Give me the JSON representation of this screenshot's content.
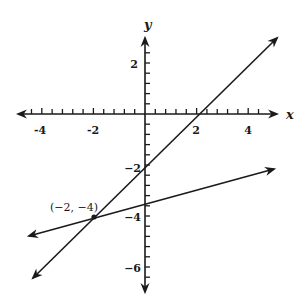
{
  "chart_data": {
    "type": "line",
    "title": "",
    "xlabel": "x",
    "ylabel": "y",
    "xlim": [
      -5,
      5
    ],
    "ylim": [
      -7,
      3.5
    ],
    "grid": false,
    "tick_spacing_minor": 0.4,
    "x_tick_labels": [
      "-4",
      "-2",
      "2",
      "4"
    ],
    "x_tick_values": [
      -4,
      -2,
      2,
      4
    ],
    "y_tick_labels": [
      "2",
      "−2",
      "−4",
      "−6"
    ],
    "y_tick_values": [
      2,
      -2,
      -4,
      -6
    ],
    "series": [
      {
        "name": "line-1",
        "equation": "y = x - 2",
        "slope": 1,
        "intercept": -2,
        "x": [
          -4.35,
          5.1
        ],
        "y": [
          -6.35,
          3.1
        ]
      },
      {
        "name": "line-2",
        "equation": "y = x/4 - 3.5",
        "slope": 0.25,
        "intercept": -3.5,
        "x": [
          -4.5,
          5.0
        ],
        "y": [
          -4.6,
          -2.2
        ]
      }
    ],
    "annotations": [
      {
        "text": "(−2, −4)",
        "x": -2,
        "y": -4,
        "marker": "dot"
      }
    ]
  },
  "labels": {
    "x_axis": "x",
    "y_axis": "y",
    "point": "(−2, −4)",
    "xt": [
      "-4",
      "-2",
      "2",
      "4"
    ],
    "yt": [
      "2",
      "−2",
      "−4",
      "−6"
    ]
  }
}
